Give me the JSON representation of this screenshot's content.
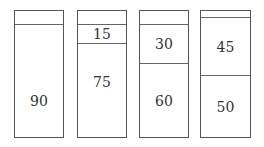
{
  "diagram": {
    "columns": [
      {
        "segments": [
          {
            "value": "",
            "units": 10
          },
          {
            "value": "90",
            "units": 90
          }
        ]
      },
      {
        "segments": [
          {
            "value": "",
            "units": 10
          },
          {
            "value": "15",
            "units": 15
          },
          {
            "value": "75",
            "units": 75
          }
        ]
      },
      {
        "segments": [
          {
            "value": "",
            "units": 10
          },
          {
            "value": "30",
            "units": 30
          },
          {
            "value": "60",
            "units": 60
          }
        ]
      },
      {
        "segments": [
          {
            "value": "",
            "units": 5
          },
          {
            "value": "45",
            "units": 45
          },
          {
            "value": "50",
            "units": 50
          }
        ]
      }
    ]
  }
}
